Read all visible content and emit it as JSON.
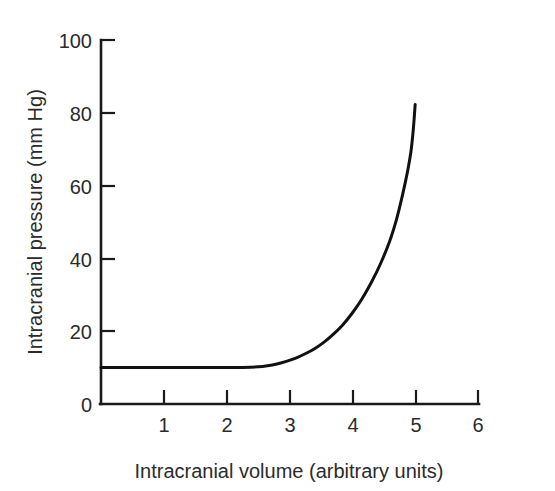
{
  "chart_data": {
    "type": "line",
    "title": "",
    "subtitle": "",
    "xlabel": "Intracranial volume (arbitrary units)",
    "ylabel": "Intracranial pressure (mm Hg)",
    "xlim": [
      0,
      6
    ],
    "ylim": [
      0,
      100
    ],
    "xticks": [
      0,
      1,
      2,
      3,
      4,
      5,
      6
    ],
    "xtick_labels": [
      "",
      "1",
      "2",
      "3",
      "4",
      "5",
      "6"
    ],
    "yticks": [
      0,
      20,
      40,
      60,
      80,
      100
    ],
    "ytick_labels": [
      "0",
      "20",
      "40",
      "60",
      "80",
      "100"
    ],
    "grid": false,
    "legend": false,
    "legend_position": "none",
    "annotations": [],
    "series": [
      {
        "name": "Intracranial pressure-volume curve",
        "color": "#111111",
        "x": [
          0.0,
          0.25,
          0.5,
          0.75,
          1.0,
          1.25,
          1.5,
          1.75,
          2.0,
          2.25,
          2.5,
          2.65,
          2.8,
          2.95,
          3.1,
          3.25,
          3.4,
          3.55,
          3.7,
          3.85,
          4.0,
          4.15,
          4.3,
          4.45,
          4.6,
          4.7,
          4.8,
          4.88,
          4.93,
          4.96,
          4.98,
          5.0
        ],
        "y": [
          10.0,
          10.0,
          10.0,
          10.0,
          10.0,
          10.0,
          10.0,
          10.0,
          10.0,
          10.05,
          10.2,
          10.5,
          11.0,
          11.7,
          12.6,
          13.8,
          15.2,
          17.0,
          19.2,
          21.8,
          25.0,
          28.8,
          33.3,
          38.6,
          45.0,
          50.5,
          57.5,
          64.0,
          69.0,
          73.5,
          77.5,
          82.3
        ]
      }
    ]
  },
  "axis_ticks": {
    "y_0": "0",
    "y_20": "20",
    "y_40": "40",
    "y_60": "60",
    "y_80": "80",
    "y_100": "100",
    "x_1": "1",
    "x_2": "2",
    "x_3": "3",
    "x_4": "4",
    "x_5": "5",
    "x_6": "6"
  },
  "labels": {
    "y_axis_title": "Intracranial pressure (mm Hg)",
    "x_axis_title": "Intracranial volume (arbitrary units)"
  },
  "colors": {
    "background": "#ffffff",
    "axis": "#1a1a1a",
    "curve": "#111111",
    "text": "#2b2b2b"
  }
}
